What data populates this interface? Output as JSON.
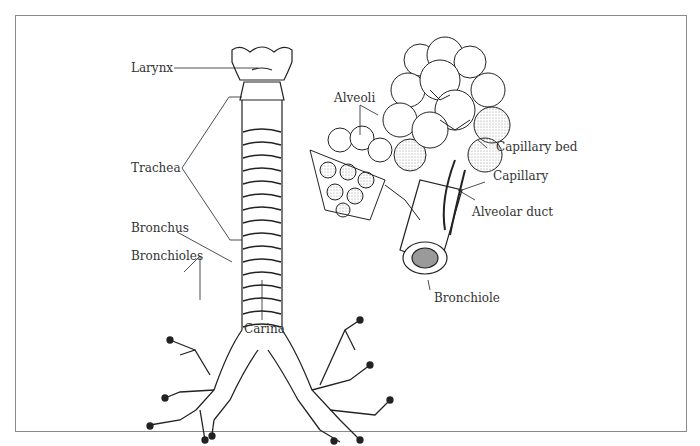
{
  "diagram": {
    "type": "anatomical-illustration",
    "labels": {
      "larynx": "Larynx",
      "trachea": "Trachea",
      "bronchus": "Bronchus",
      "bronchioles": "Bronchioles",
      "carina": "Carina",
      "alveoli": "Alveoli",
      "capillary_bed": "Capillary bed",
      "capillary": "Capillary",
      "alveolar_duct": "Alveolar duct",
      "bronchiole": "Bronchiole"
    },
    "colors": {
      "line": "#222222",
      "text": "#333333",
      "frame": "#8a8a8a",
      "shade": "#9a9a9a"
    }
  }
}
